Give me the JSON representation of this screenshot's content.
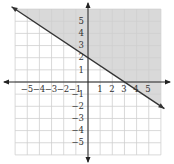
{
  "chart_data": {
    "type": "line",
    "title": "",
    "xlabel": "",
    "ylabel": "",
    "xlim": [
      -6,
      6
    ],
    "ylim": [
      -6,
      6
    ],
    "grid": true,
    "x_tick_labels": [
      "−5",
      "−4",
      "−3",
      "−2",
      "−1",
      "1",
      "2",
      "3",
      "4",
      "5"
    ],
    "y_tick_labels": [
      "5",
      "4",
      "3",
      "2",
      "1",
      "−1",
      "−2",
      "−3",
      "−4",
      "−5"
    ],
    "x_ticks": [
      -5,
      -4,
      -3,
      -2,
      -1,
      1,
      2,
      3,
      4,
      5
    ],
    "y_ticks": [
      5,
      4,
      3,
      2,
      1,
      -1,
      -2,
      -3,
      -4,
      -5
    ],
    "series": [
      {
        "name": "boundary line",
        "equation": "y = -2/3 x + 2",
        "x": [
          -6,
          0,
          3,
          6
        ],
        "y": [
          6,
          2,
          0,
          -2
        ],
        "style": "solid",
        "arrows": "both ends"
      }
    ],
    "shaded_region": {
      "description": "y >= -2/3 x + 2 (region above line)",
      "color": "#d9d9d9"
    }
  },
  "colors": {
    "grid": "#cfcfcf",
    "axis": "#222222",
    "line": "#333333",
    "shade": "#d9d9d9"
  }
}
